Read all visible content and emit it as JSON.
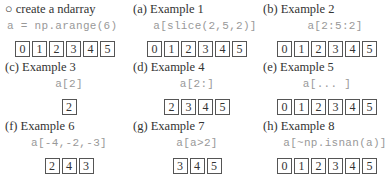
{
  "panels": [
    {
      "label": "○ create a ndarray",
      "code": "a = np.arange(6)",
      "values": [
        0,
        1,
        2,
        3,
        4,
        5
      ],
      "code_align": "left"
    },
    {
      "label": "(a) Example 1",
      "code": "a[slice(2,5,2)]",
      "values": [
        0,
        1,
        2,
        3,
        4,
        5
      ]
    },
    {
      "label": "(b)  Example 2",
      "code": "a[2:5:2]",
      "values": [
        0,
        1,
        2,
        3,
        4,
        5
      ]
    },
    {
      "label": "(c) Example 3",
      "code": "a[2]",
      "values": [
        2
      ]
    },
    {
      "label": "(d) Example 4",
      "code": "a[2:]",
      "values": [
        2,
        3,
        4,
        5
      ]
    },
    {
      "label": "(e) Example 5",
      "code": "a[... ]",
      "values": [
        0,
        1,
        2,
        3,
        4,
        5
      ]
    },
    {
      "label": "(f) Example 6",
      "code": "a[-4,-2,-3]",
      "values": [
        2,
        4,
        3
      ]
    },
    {
      "label": "(g) Example 7",
      "code": "a[a>2]",
      "values": [
        3,
        4,
        5
      ]
    },
    {
      "label": "(h) Example 8",
      "code": "a[~np.isnan(a)]",
      "values": [
        0,
        1,
        2,
        3,
        4,
        5
      ]
    }
  ],
  "colors": {
    "label": "#333333",
    "code": "#999999",
    "box_border": "#555555"
  }
}
